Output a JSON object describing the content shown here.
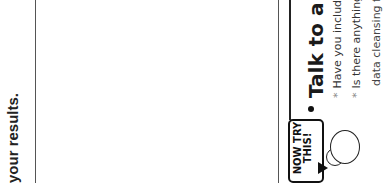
{
  "page": {
    "orientation": "rotated-90-counterclockwise",
    "left_column": {
      "text_fragment": "your results."
    },
    "tip_box": {
      "badge": {
        "line1": "NOW TRY",
        "line2": "THIS!"
      },
      "heading": "Talk to a pa",
      "items": [
        "Have you includ",
        "Is there anything",
        "data cleansing fo"
      ],
      "bullet_marker": "*"
    },
    "colors": {
      "background": "#ffffff",
      "text": "#1a1a1a",
      "rule": "#555555"
    }
  }
}
